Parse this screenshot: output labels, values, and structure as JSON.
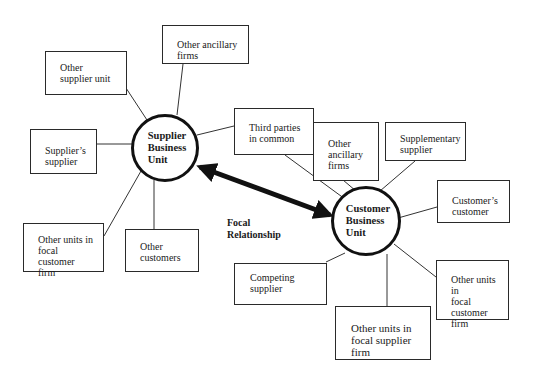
{
  "diagram": {
    "type": "network",
    "hubs": [
      {
        "id": "supplier",
        "label": "Supplier\nBusiness\nUnit"
      },
      {
        "id": "customer",
        "label": "Customer\nBusiness\nUnit"
      }
    ],
    "focal_relationship": {
      "label": "Focal\nRelationship",
      "from": "supplier",
      "to": "customer",
      "style": "double-arrow"
    },
    "nodes": [
      {
        "id": "other-supplier-unit",
        "label": "Other\nsupplier unit",
        "hub": "supplier"
      },
      {
        "id": "other-ancillary-firms-supplier",
        "label": "Other ancillary\nfirms",
        "hub": "supplier"
      },
      {
        "id": "suppliers-supplier",
        "label": "Supplier’s\nsupplier",
        "hub": "supplier"
      },
      {
        "id": "third-parties",
        "label": "Third parties\nin common",
        "hub": "both"
      },
      {
        "id": "other-units-focal-customer-left",
        "label": "Other units in\nfocal customer\nfirm",
        "hub": "supplier"
      },
      {
        "id": "other-customers",
        "label": "Other\ncustomers",
        "hub": "supplier"
      },
      {
        "id": "other-ancillary-firms-customer",
        "label": "Other\nancillary\nfirms",
        "hub": "customer"
      },
      {
        "id": "supplementary-supplier",
        "label": "Supplementary\nsupplier",
        "hub": "customer"
      },
      {
        "id": "customers-customer",
        "label": "Customer’s\ncustomer",
        "hub": "customer"
      },
      {
        "id": "competing-supplier",
        "label": "Competing\nsupplier",
        "hub": "customer"
      },
      {
        "id": "other-units-focal-customer-right",
        "label": "Other units in\nfocal\ncustomer\nfirm",
        "hub": "customer"
      },
      {
        "id": "other-units-focal-supplier",
        "label": "Other units in\nfocal supplier\nfirm",
        "hub": "customer"
      }
    ]
  }
}
